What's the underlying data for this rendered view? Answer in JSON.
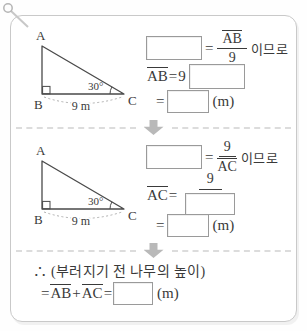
{
  "figure": {
    "vertex_a": "A",
    "vertex_b": "B",
    "vertex_c": "C",
    "angle_label": "30°",
    "base_label": "9 m"
  },
  "step1": {
    "line1": {
      "eq": "=",
      "frac_num": "AB",
      "frac_den": "9",
      "suffix": "이므로"
    },
    "line2": {
      "lhs": "AB",
      "eq": "=",
      "coeff": "9"
    },
    "line3": {
      "eq": "=",
      "unit": "(m)"
    }
  },
  "step2": {
    "line1": {
      "eq": "=",
      "frac_num": "9",
      "frac_den": "AC",
      "suffix": "이므로"
    },
    "line2": {
      "lhs": "AC",
      "eq": "=",
      "frac_num": "9"
    },
    "line3": {
      "eq": "=",
      "unit": "(m)"
    }
  },
  "step3": {
    "conclusion": "∴ (부러지기 전 나무의 높이)",
    "eq_lhs": "=",
    "term1": "AB",
    "plus": "+",
    "term2": "AC",
    "eq2": "=",
    "unit": "(m)"
  },
  "colors": {
    "card_border": "#c9c9c9",
    "text": "#3a3a3a",
    "arrow": "#b9b9b9",
    "divider": "#dcdcdc",
    "blank_border": "#9a9a9a"
  }
}
